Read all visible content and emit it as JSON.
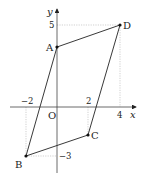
{
  "diagram": {
    "type": "coordinate-plane-parallelogram",
    "axes": {
      "x_label": "x",
      "y_label": "y",
      "origin_label": "O",
      "x_ticks": [
        {
          "value": -2,
          "label": "−2"
        },
        {
          "value": 2,
          "label": "2"
        },
        {
          "value": 4,
          "label": "4"
        }
      ],
      "y_ticks": [
        {
          "value": 5,
          "label": "5"
        },
        {
          "value": -3,
          "label": "−3"
        }
      ]
    },
    "points": [
      {
        "name": "A",
        "label": "A",
        "x": 0,
        "y": 3.7
      },
      {
        "name": "B",
        "label": "B",
        "x": -2,
        "y": -3
      },
      {
        "name": "C",
        "label": "C",
        "x": 2,
        "y": -1.7
      },
      {
        "name": "D",
        "label": "D",
        "x": 4,
        "y": 5
      }
    ],
    "polygon": [
      "A",
      "B",
      "C",
      "D"
    ],
    "colors": {
      "line": "#222222",
      "guide": "#bbbbbb"
    }
  }
}
